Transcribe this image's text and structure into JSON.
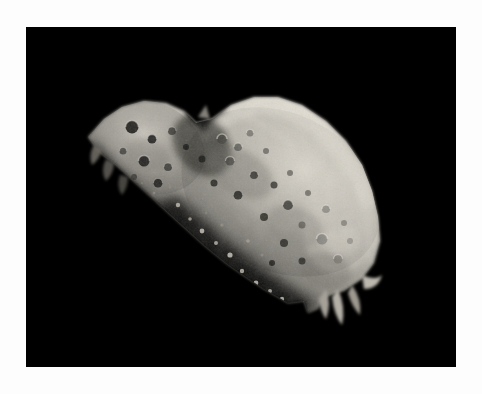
{
  "page": {
    "background_color": "#fdfdfd",
    "width": 482,
    "height": 394
  },
  "photo": {
    "subject": "asteroid",
    "alt_text": "Grayscale spacecraft photograph of an irregular, elongated asteroid illuminated from the upper right against a black space background",
    "frame": {
      "left": 26,
      "top": 27,
      "width": 430,
      "height": 340,
      "background_color": "#000000"
    },
    "palette": {
      "space_black": "#000000",
      "terminator_shadow": "#14140f",
      "dark_regolith": "#4a4843",
      "mid_regolith": "#8f8d86",
      "lit_surface": "#b4b2aa",
      "bright_surface": "#cfcdc5",
      "highlight": "#ded9d0",
      "crater_shadow": "#16150f"
    },
    "body_outline": "M 62 110 L 78 92 L 96 80 L 118 74 L 140 76 L 158 84 L 170 96 L 186 92 L 205 78 L 228 70 L 252 70 L 276 78 L 300 94 L 320 114 L 336 138 L 346 164 L 352 190 L 354 214 L 348 236 L 336 252 L 318 264 L 300 270 L 292 282 L 282 286 L 278 274 L 262 276 L 252 270 L 238 262 L 220 250 L 200 236 L 178 218 L 156 198 L 134 178 L 112 158 L 90 138 L 72 124 Z",
    "lit_region": "M 170 96 L 188 92 L 208 78 L 232 70 L 256 71 L 280 81 L 302 98 L 322 120 L 338 146 L 348 174 L 352 200 L 348 226 L 336 248 L 318 262 L 298 268 L 276 266 L 252 256 L 228 240 L 206 222 L 188 202 L 176 180 L 170 156 L 168 126 Z",
    "craters": [
      {
        "cx": 106,
        "cy": 100,
        "r": 6.5,
        "tone": "deep"
      },
      {
        "cx": 126,
        "cy": 112,
        "r": 4.5,
        "tone": "deep"
      },
      {
        "cx": 146,
        "cy": 104,
        "r": 4.0,
        "tone": "mid"
      },
      {
        "cx": 118,
        "cy": 134,
        "r": 5.5,
        "tone": "deep"
      },
      {
        "cx": 142,
        "cy": 140,
        "r": 4.0,
        "tone": "mid"
      },
      {
        "cx": 97,
        "cy": 124,
        "r": 3.5,
        "tone": "mid"
      },
      {
        "cx": 132,
        "cy": 156,
        "r": 4.5,
        "tone": "deep"
      },
      {
        "cx": 108,
        "cy": 150,
        "r": 3.0,
        "tone": "mid"
      },
      {
        "cx": 160,
        "cy": 120,
        "r": 3.0,
        "tone": "deep"
      },
      {
        "cx": 176,
        "cy": 132,
        "r": 3.5,
        "tone": "deep"
      },
      {
        "cx": 196,
        "cy": 112,
        "r": 5.0,
        "tone": "mid"
      },
      {
        "cx": 212,
        "cy": 120,
        "r": 4.0,
        "tone": "mid"
      },
      {
        "cx": 204,
        "cy": 134,
        "r": 4.5,
        "tone": "mid"
      },
      {
        "cx": 224,
        "cy": 106,
        "r": 3.5,
        "tone": "light"
      },
      {
        "cx": 240,
        "cy": 124,
        "r": 3.0,
        "tone": "mid"
      },
      {
        "cx": 228,
        "cy": 148,
        "r": 4.0,
        "tone": "deep"
      },
      {
        "cx": 248,
        "cy": 158,
        "r": 3.5,
        "tone": "deep"
      },
      {
        "cx": 264,
        "cy": 146,
        "r": 3.0,
        "tone": "mid"
      },
      {
        "cx": 212,
        "cy": 168,
        "r": 4.5,
        "tone": "deep"
      },
      {
        "cx": 188,
        "cy": 156,
        "r": 3.5,
        "tone": "deep"
      },
      {
        "cx": 262,
        "cy": 178,
        "r": 5.0,
        "tone": "deep"
      },
      {
        "cx": 282,
        "cy": 166,
        "r": 3.0,
        "tone": "mid"
      },
      {
        "cx": 238,
        "cy": 190,
        "r": 4.0,
        "tone": "deep"
      },
      {
        "cx": 276,
        "cy": 198,
        "r": 3.5,
        "tone": "mid"
      },
      {
        "cx": 300,
        "cy": 182,
        "r": 4.0,
        "tone": "light"
      },
      {
        "cx": 296,
        "cy": 212,
        "r": 5.5,
        "tone": "light"
      },
      {
        "cx": 318,
        "cy": 196,
        "r": 3.0,
        "tone": "mid"
      },
      {
        "cx": 258,
        "cy": 216,
        "r": 4.0,
        "tone": "deep"
      },
      {
        "cx": 276,
        "cy": 234,
        "r": 3.5,
        "tone": "deep"
      },
      {
        "cx": 246,
        "cy": 236,
        "r": 3.0,
        "tone": "deep"
      },
      {
        "cx": 312,
        "cy": 232,
        "r": 4.5,
        "tone": "light"
      },
      {
        "cx": 324,
        "cy": 214,
        "r": 3.0,
        "tone": "light"
      }
    ],
    "terminator_specks": [
      {
        "cx": 152,
        "cy": 178,
        "r": 2.2
      },
      {
        "cx": 164,
        "cy": 192,
        "r": 1.8
      },
      {
        "cx": 140,
        "cy": 190,
        "r": 1.6
      },
      {
        "cx": 176,
        "cy": 204,
        "r": 2.4
      },
      {
        "cx": 158,
        "cy": 210,
        "r": 1.5
      },
      {
        "cx": 190,
        "cy": 216,
        "r": 2.0
      },
      {
        "cx": 172,
        "cy": 226,
        "r": 1.7
      },
      {
        "cx": 204,
        "cy": 228,
        "r": 2.6
      },
      {
        "cx": 188,
        "cy": 240,
        "r": 1.9
      },
      {
        "cx": 216,
        "cy": 244,
        "r": 2.2
      },
      {
        "cx": 200,
        "cy": 254,
        "r": 1.6
      },
      {
        "cx": 230,
        "cy": 256,
        "r": 2.4
      },
      {
        "cx": 212,
        "cy": 266,
        "r": 1.8
      },
      {
        "cx": 244,
        "cy": 264,
        "r": 2.0
      },
      {
        "cx": 226,
        "cy": 274,
        "r": 1.5
      },
      {
        "cx": 256,
        "cy": 272,
        "r": 2.2
      },
      {
        "cx": 128,
        "cy": 166,
        "r": 1.5
      },
      {
        "cx": 116,
        "cy": 156,
        "r": 1.3
      },
      {
        "cx": 144,
        "cy": 160,
        "r": 1.4
      },
      {
        "cx": 238,
        "cy": 282,
        "r": 1.7
      },
      {
        "cx": 266,
        "cy": 286,
        "r": 2.0
      },
      {
        "cx": 252,
        "cy": 292,
        "r": 1.5
      },
      {
        "cx": 180,
        "cy": 186,
        "r": 1.4
      },
      {
        "cx": 196,
        "cy": 198,
        "r": 1.6
      },
      {
        "cx": 222,
        "cy": 214,
        "r": 1.8
      },
      {
        "cx": 236,
        "cy": 228,
        "r": 1.5
      }
    ]
  }
}
